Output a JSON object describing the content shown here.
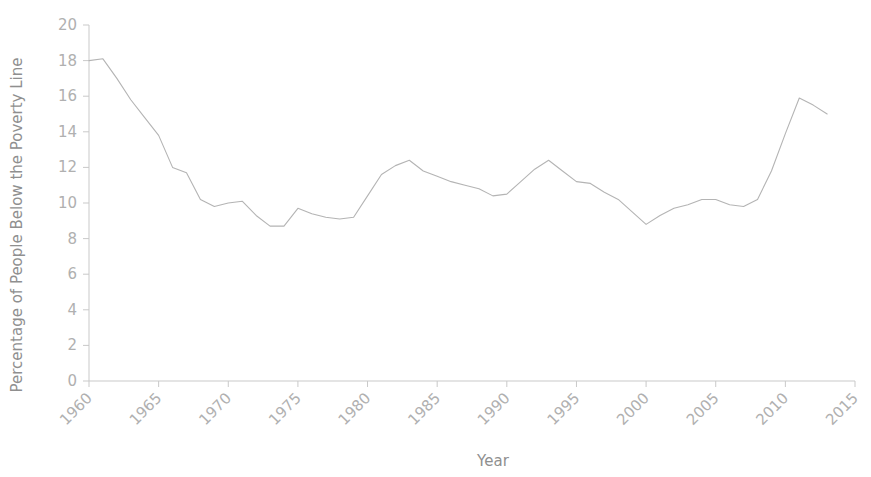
{
  "chart_data": {
    "type": "line",
    "title": "",
    "xlabel": "Year",
    "ylabel": "Percentage of People Below the Poverty Line",
    "xlim": [
      1960,
      2015
    ],
    "ylim": [
      0,
      20
    ],
    "grid": false,
    "legend": null,
    "xticks": [
      "1960",
      "1965",
      "1970",
      "1975",
      "1980",
      "1985",
      "1990",
      "1995",
      "2000",
      "2005",
      "2010",
      "2015"
    ],
    "xtick_values": [
      1960,
      1965,
      1970,
      1975,
      1980,
      1985,
      1990,
      1995,
      2000,
      2005,
      2010,
      2015
    ],
    "yticks": [
      "0",
      "2",
      "4",
      "6",
      "8",
      "10",
      "12",
      "14",
      "16",
      "18",
      "20"
    ],
    "ytick_values": [
      0,
      2,
      4,
      6,
      8,
      10,
      12,
      14,
      16,
      18,
      20
    ],
    "series": [
      {
        "name": "Percentage of People Below the Poverty Line",
        "color": "#b4b4b4",
        "x": [
          1960,
          1961,
          1962,
          1963,
          1964,
          1965,
          1966,
          1967,
          1968,
          1969,
          1970,
          1971,
          1972,
          1973,
          1974,
          1975,
          1976,
          1977,
          1978,
          1979,
          1980,
          1981,
          1982,
          1983,
          1984,
          1985,
          1986,
          1987,
          1988,
          1989,
          1990,
          1991,
          1992,
          1993,
          1994,
          1995,
          1996,
          1997,
          1998,
          1999,
          2000,
          2001,
          2002,
          2003,
          2004,
          2005,
          2006,
          2007,
          2008,
          2009,
          2010,
          2011,
          2012,
          2013
        ],
        "values": [
          18.0,
          18.1,
          17.0,
          15.8,
          14.8,
          13.8,
          12.0,
          11.7,
          10.2,
          9.8,
          10.0,
          10.1,
          9.3,
          8.7,
          8.7,
          9.7,
          9.4,
          9.2,
          9.1,
          9.2,
          10.4,
          11.6,
          12.1,
          12.4,
          11.8,
          11.5,
          11.2,
          11.0,
          10.8,
          10.4,
          10.5,
          11.2,
          11.9,
          12.4,
          11.8,
          11.2,
          11.1,
          10.6,
          10.2,
          9.5,
          8.8,
          9.3,
          9.7,
          9.9,
          10.2,
          10.2,
          9.9,
          9.8,
          10.2,
          11.8,
          13.9,
          15.9,
          15.5,
          15.0
        ]
      }
    ]
  }
}
